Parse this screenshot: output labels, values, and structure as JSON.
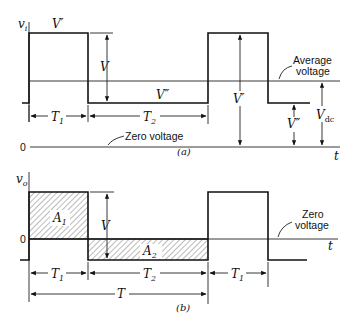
{
  "figure_a": {
    "y_axis_label": "v",
    "y_axis_sub": "i",
    "x_axis_label": "t",
    "caption": "(a)",
    "labels": {
      "v_prime_top": "V′",
      "v_swing": "V",
      "v_double_prime": "V″",
      "v_prime_right": "V′",
      "v_double_prime_right": "V″",
      "v_dc": "V",
      "v_dc_sub": "dc",
      "t1": "T",
      "t1_sub": "1",
      "t2": "T",
      "t2_sub": "2",
      "zero_level": "0"
    },
    "annotations": {
      "average_line1": "Average",
      "average_line2": "voltage",
      "zero_voltage": "Zero voltage"
    }
  },
  "figure_b": {
    "y_axis_label": "v",
    "y_axis_sub": "o",
    "x_axis_label": "t",
    "caption": "(b)",
    "labels": {
      "zero_level": "0",
      "a1": "A",
      "a1_sub": "1",
      "a2": "A",
      "a2_sub": "2",
      "v_swing": "V",
      "t1": "T",
      "t1_sub": "1",
      "t2": "T",
      "t2_sub": "2",
      "t1_right": "T",
      "t1_right_sub": "1",
      "period": "T"
    },
    "annotations": {
      "zero_line1": "Zero",
      "zero_line2": "voltage"
    }
  }
}
